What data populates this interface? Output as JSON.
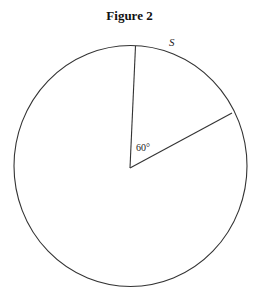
{
  "figure": {
    "title": "Figure 2",
    "arc_label": "S",
    "angle_label": "60°",
    "central_angle_deg": 60,
    "stroke_color": "#333333"
  }
}
